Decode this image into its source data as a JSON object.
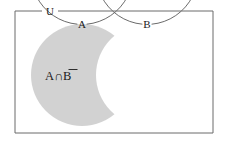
{
  "figure": {
    "type": "venn-diagram",
    "universe_label": "U",
    "set_a_label": "A",
    "set_b_label": "B",
    "region_label": "A∩B",
    "region_label_plain": "A ∩ B-complement",
    "region_overline_on": "B",
    "shaded_region": "A minus B",
    "colors": {
      "shade_fill": "#d2d2d2",
      "stroke": "#6b6b6b",
      "text": "#1a1a1a",
      "background": "#ffffff"
    },
    "geometry": {
      "rect": {
        "x": 15,
        "y": 11,
        "width": 198,
        "height": 122
      },
      "circle_a": {
        "cx": 82,
        "cy": 75,
        "r": 51
      },
      "circle_b": {
        "cx": 147,
        "cy": 75,
        "r": 51
      }
    }
  }
}
